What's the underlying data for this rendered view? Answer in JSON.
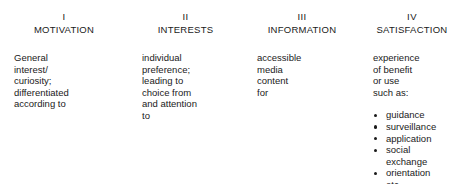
{
  "diagram": {
    "type": "four-stage-process",
    "background_color": "#ffffff",
    "text_color": "#1a1a1a",
    "columns": [
      {
        "numeral": "I",
        "title": "MOTIVATION",
        "body_lines": [
          "General",
          "interest/",
          "curiosity;",
          "differentiated",
          "according to"
        ],
        "bullets": []
      },
      {
        "numeral": "II",
        "title": "INTERESTS",
        "body_lines": [
          "individual",
          "preference;",
          "leading to",
          "choice from",
          "and attention",
          "to"
        ],
        "bullets": []
      },
      {
        "numeral": "III",
        "title": "INFORMATION",
        "body_lines": [
          "accessible",
          "media",
          "content",
          "for"
        ],
        "bullets": []
      },
      {
        "numeral": "IV",
        "title": "SATISFACTION",
        "body_lines": [
          "experience",
          "of benefit",
          "or use",
          "such as:"
        ],
        "bullets": [
          {
            "label": "guidance",
            "marker": true,
            "continuation": ""
          },
          {
            "label": "surveillance",
            "marker": true,
            "continuation": ""
          },
          {
            "label": "application",
            "marker": true,
            "continuation": ""
          },
          {
            "label": "social",
            "marker": true,
            "continuation": "exchange"
          },
          {
            "label": "orientation",
            "marker": true,
            "continuation": ""
          },
          {
            "label": "etc.",
            "marker": false,
            "continuation": ""
          }
        ]
      }
    ]
  }
}
